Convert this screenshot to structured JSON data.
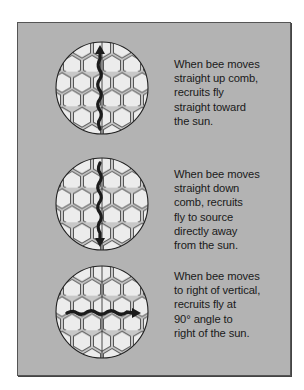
{
  "panel": {
    "background": "#b3b3b3",
    "rows": [
      {
        "direction": "up",
        "caption": "When bee moves\nstraight up comb,\nrecruits fly\nstraight toward\nthe sun."
      },
      {
        "direction": "down",
        "caption": "When bee moves\nstraight down\ncomb, recruits\nfly to source\ndirectly away\nfrom the sun."
      },
      {
        "direction": "right",
        "caption": "When bee moves\nto right of vertical,\nrecruits fly at\n90° angle to\nright of the sun."
      }
    ]
  }
}
